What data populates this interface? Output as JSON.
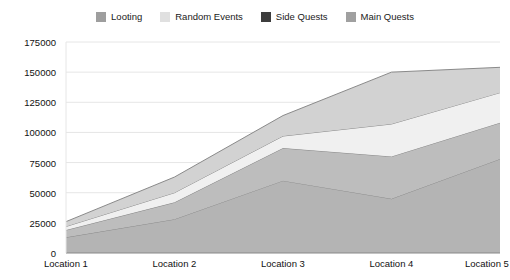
{
  "chart_data": {
    "type": "area",
    "stacked": true,
    "title": "",
    "xlabel": "",
    "ylabel": "",
    "categories": [
      "Location 1",
      "Location 2",
      "Location 3",
      "Location 4",
      "Location 5"
    ],
    "ylim": [
      0,
      175000
    ],
    "yticks": [
      0,
      25000,
      50000,
      75000,
      100000,
      125000,
      150000,
      175000
    ],
    "ytick_labels": [
      "0",
      "25000",
      "50000",
      "75000",
      "100000",
      "125000",
      "150000",
      "175000"
    ],
    "grid": true,
    "legend_position": "top-center",
    "series": [
      {
        "name": "Main Quests",
        "color": "#a8a8a8",
        "values": [
          13000,
          28000,
          60000,
          45000,
          78000
        ]
      },
      {
        "name": "Side Quests",
        "color": "#3d3d3d",
        "values": [
          6000,
          14000,
          27000,
          35000,
          30000
        ]
      },
      {
        "name": "Random Events",
        "color": "#e8e8e8",
        "values": [
          3000,
          8000,
          10000,
          27000,
          25000
        ]
      },
      {
        "name": "Looting",
        "color": "#9e9e9e",
        "values": [
          4000,
          13000,
          17000,
          43000,
          21000
        ]
      }
    ],
    "stack_order": [
      "Main Quests",
      "Side Quests",
      "Random Events",
      "Looting"
    ],
    "band_fills": {
      "Main Quests": "#b4b4b4",
      "Side Quests": "#bdbdbd",
      "Random Events": "#f0f0f0",
      "Looting": "#d2d2d2"
    },
    "totals": [
      26000,
      63000,
      114000,
      150000,
      154000
    ],
    "axis_color": "#888888",
    "grid_color": "#e6e6e6",
    "line_color": "#8a8a8a",
    "background": "#ffffff"
  },
  "legend": {
    "entries": [
      {
        "label": "Looting",
        "swatch": "#9e9e9e"
      },
      {
        "label": "Random Events",
        "swatch": "#e0e0e0"
      },
      {
        "label": "Side Quests",
        "swatch": "#3d3d3d"
      },
      {
        "label": "Main Quests",
        "swatch": "#a0a0a0"
      }
    ]
  }
}
